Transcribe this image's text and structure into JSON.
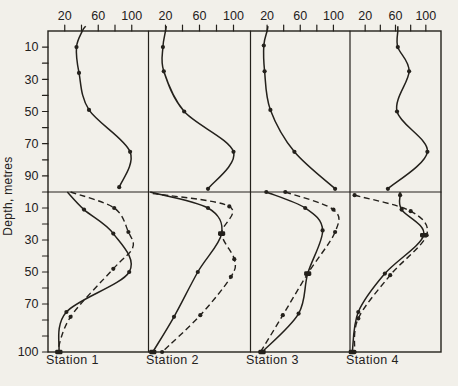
{
  "figure": {
    "kind": "scanned-depth-profile-figure",
    "station_count": 4
  },
  "chart_data": {
    "type": "line",
    "title": "",
    "xlabel": "",
    "ylabel": "Depth, metres",
    "x_axis": {
      "position": "top",
      "ticks": [
        20,
        40,
        60,
        80,
        100
      ],
      "labeled_ticks": [
        "20",
        "60",
        "100"
      ],
      "range": [
        0,
        120
      ]
    },
    "y_axis": {
      "label": "Depth, metres",
      "upper_row": {
        "ticks": [
          10,
          20,
          30,
          40,
          50,
          60,
          70,
          80,
          90
        ],
        "labels": [
          10,
          30,
          50,
          70,
          90
        ],
        "range": [
          0,
          100
        ]
      },
      "lower_row": {
        "ticks": [
          10,
          20,
          30,
          40,
          50,
          60,
          70,
          80,
          90,
          100
        ],
        "labels": [
          10,
          30,
          50,
          70,
          100
        ],
        "range": [
          0,
          100
        ]
      }
    },
    "point_format": "[value, depth_m, marker(0=none,1=dot,2=bold)]",
    "stations": [
      {
        "label": "Station 1",
        "upper_profile": {
          "style": "solid",
          "points": [
            [
              45,
              -3,
              0
            ],
            [
              41,
              0,
              0
            ],
            [
              34,
              10,
              1
            ],
            [
              37,
              26,
              1
            ],
            [
              49,
              49,
              1
            ],
            [
              98,
              75,
              1
            ],
            [
              85,
              97,
              1
            ]
          ]
        },
        "lower_profiles": {
          "solid": [
            [
              23,
              0,
              0
            ],
            [
              43,
              11,
              1
            ],
            [
              78,
              26,
              1
            ],
            [
              97,
              50,
              1
            ],
            [
              22,
              75,
              1
            ],
            [
              13,
              100,
              2
            ]
          ],
          "dashed": [
            [
              27,
              0,
              0
            ],
            [
              79,
              10,
              1
            ],
            [
              96,
              25,
              1
            ],
            [
              101,
              35,
              0
            ],
            [
              78,
              48,
              1
            ],
            [
              27,
              78,
              1
            ],
            [
              11,
              100,
              1
            ]
          ]
        }
      },
      {
        "label": "Station 2",
        "upper_profile": {
          "style": "solid",
          "points": [
            [
              21,
              -3,
              0
            ],
            [
              20,
              0,
              0
            ],
            [
              17,
              10,
              1
            ],
            [
              18,
              25,
              1
            ],
            [
              42,
              50,
              1
            ],
            [
              100,
              75,
              1
            ],
            [
              70,
              98,
              1
            ]
          ]
        },
        "lower_profiles": {
          "solid": [
            [
              2,
              0,
              0
            ],
            [
              70,
              10,
              1
            ],
            [
              86,
              26,
              2
            ],
            [
              58,
              50,
              1
            ],
            [
              30,
              78,
              1
            ],
            [
              5,
              100,
              2
            ]
          ],
          "dashed": [
            [
              5,
              1,
              0
            ],
            [
              95,
              9,
              1
            ],
            [
              86,
              26,
              1
            ],
            [
              101,
              42,
              1
            ],
            [
              97,
              53,
              1
            ],
            [
              61,
              77,
              1
            ],
            [
              16,
              100,
              1
            ]
          ]
        }
      },
      {
        "label": "Station 3",
        "upper_profile": {
          "style": "solid",
          "points": [
            [
              21,
              -3,
              0
            ],
            [
              20,
              0,
              0
            ],
            [
              16,
              9,
              1
            ],
            [
              17,
              25,
              1
            ],
            [
              24,
              49,
              1
            ],
            [
              53,
              75,
              1
            ],
            [
              102,
              98,
              1
            ]
          ]
        },
        "lower_profiles": {
          "solid": [
            [
              19,
              0,
              1
            ],
            [
              66,
              10,
              1
            ],
            [
              87,
              24,
              1
            ],
            [
              69,
              51,
              2
            ],
            [
              58,
              76,
              1
            ],
            [
              14,
              100,
              2
            ]
          ],
          "dashed": [
            [
              42,
              0,
              1
            ],
            [
              100,
              11,
              1
            ],
            [
              102,
              25,
              1
            ],
            [
              69,
              51,
              1
            ],
            [
              39,
              77,
              1
            ],
            [
              12,
              100,
              1
            ]
          ]
        }
      },
      {
        "label": "Station 4",
        "upper_profile": {
          "style": "solid",
          "points": [
            [
              63,
              -3,
              0
            ],
            [
              63,
              0,
              0
            ],
            [
              63,
              10,
              1
            ],
            [
              78,
              25,
              1
            ],
            [
              62,
              50,
              1
            ],
            [
              102,
              75,
              1
            ],
            [
              50,
              98,
              1
            ]
          ]
        },
        "lower_profiles": {
          "solid": [
            [
              66,
              0,
              0
            ],
            [
              66,
              2,
              1
            ],
            [
              68,
              11,
              1
            ],
            [
              97,
              27,
              2
            ],
            [
              46,
              51,
              1
            ],
            [
              11,
              75,
              1
            ],
            [
              3,
              100,
              2
            ]
          ],
          "dashed": [
            [
              6,
              2,
              1
            ],
            [
              80,
              12,
              1
            ],
            [
              101,
              27,
              1
            ],
            [
              53,
              52,
              1
            ],
            [
              11,
              79,
              1
            ],
            [
              6,
              100,
              1
            ]
          ]
        }
      }
    ],
    "legend": {
      "solid_line": "profile (solid)",
      "dashed_line": "profile (dashed)"
    },
    "grid": false,
    "colors": {
      "ink": "#24211c",
      "paper": "#f2f0ea"
    }
  }
}
